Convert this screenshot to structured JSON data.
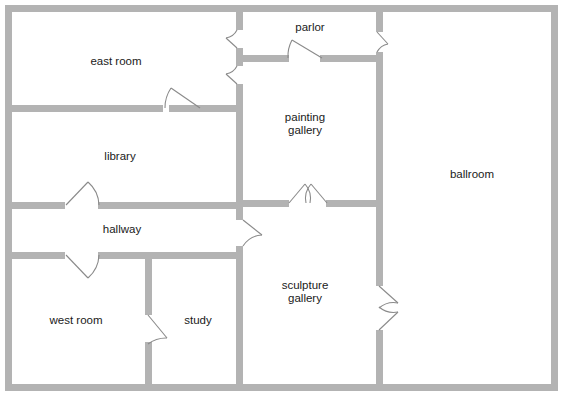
{
  "document": {
    "title": "Museum Floor Plan",
    "width": 570,
    "height": 403,
    "background_color": "#ffffff",
    "wall_color": "#b3b3b3",
    "door_color": "#8a8a8a",
    "label_color": "#1a1a1a"
  },
  "rooms": [
    {
      "id": "east-room",
      "label": "east room",
      "label_lines": [
        "east room"
      ],
      "label_x": 116,
      "label_y": 62,
      "bounds": {
        "x": 8,
        "y": 8,
        "width": 232,
        "height": 100
      }
    },
    {
      "id": "library",
      "label": "library",
      "label_lines": [
        "library"
      ],
      "label_x": 120,
      "label_y": 157,
      "bounds": {
        "x": 8,
        "y": 108,
        "width": 232,
        "height": 97
      }
    },
    {
      "id": "hallway",
      "label": "hallway",
      "label_lines": [
        "hallway"
      ],
      "label_x": 122,
      "label_y": 230,
      "bounds": {
        "x": 8,
        "y": 205,
        "width": 232,
        "height": 50
      }
    },
    {
      "id": "west-room",
      "label": "west room",
      "label_lines": [
        "west room"
      ],
      "label_x": 76,
      "label_y": 321,
      "bounds": {
        "x": 8,
        "y": 255,
        "width": 140,
        "height": 135
      }
    },
    {
      "id": "study",
      "label": "study",
      "label_lines": [
        "study"
      ],
      "label_x": 198,
      "label_y": 321,
      "bounds": {
        "x": 148,
        "y": 255,
        "width": 92,
        "height": 135
      }
    },
    {
      "id": "parlor",
      "label": "parlor",
      "label_lines": [
        "parlor"
      ],
      "label_x": 310,
      "label_y": 28,
      "bounds": {
        "x": 240,
        "y": 8,
        "width": 140,
        "height": 50
      }
    },
    {
      "id": "painting-gallery",
      "label": "painting gallery",
      "label_lines": [
        "painting",
        "gallery"
      ],
      "label_x": 305,
      "label_y": 124,
      "bounds": {
        "x": 240,
        "y": 58,
        "width": 140,
        "height": 147
      }
    },
    {
      "id": "sculpture-gallery",
      "label": "sculpture gallery",
      "label_lines": [
        "sculpture",
        "gallery"
      ],
      "label_x": 305,
      "label_y": 292,
      "bounds": {
        "x": 240,
        "y": 205,
        "width": 140,
        "height": 185
      }
    },
    {
      "id": "ballroom",
      "label": "ballroom",
      "label_lines": [
        "ballroom"
      ],
      "label_x": 472,
      "label_y": 175,
      "bounds": {
        "x": 380,
        "y": 8,
        "width": 178,
        "height": 382
      }
    }
  ],
  "doors": [
    {
      "id": "east-room-to-parlor",
      "between": [
        "east room",
        "parlor"
      ],
      "orientation": "vertical"
    },
    {
      "id": "east-room-to-painting-gallery",
      "between": [
        "east room",
        "painting gallery"
      ],
      "orientation": "vertical"
    },
    {
      "id": "east-room-to-library",
      "between": [
        "east room",
        "library"
      ],
      "orientation": "horizontal"
    },
    {
      "id": "parlor-to-painting-gallery",
      "between": [
        "parlor",
        "painting gallery"
      ],
      "orientation": "horizontal"
    },
    {
      "id": "parlor-to-ballroom",
      "between": [
        "parlor",
        "ballroom"
      ],
      "orientation": "vertical"
    },
    {
      "id": "library-to-hallway",
      "between": [
        "library",
        "hallway"
      ],
      "orientation": "horizontal"
    },
    {
      "id": "hallway-to-west-room",
      "between": [
        "hallway",
        "west room"
      ],
      "orientation": "horizontal"
    },
    {
      "id": "hallway-to-sculpture-gallery",
      "between": [
        "hallway",
        "sculpture gallery"
      ],
      "orientation": "vertical"
    },
    {
      "id": "west-room-to-study",
      "between": [
        "west room",
        "study"
      ],
      "orientation": "vertical"
    },
    {
      "id": "painting-gallery-to-sculpture-gallery",
      "between": [
        "painting gallery",
        "sculpture gallery"
      ],
      "orientation": "horizontal",
      "type": "double"
    },
    {
      "id": "sculpture-gallery-to-ballroom",
      "between": [
        "sculpture gallery",
        "ballroom"
      ],
      "orientation": "vertical",
      "type": "double"
    }
  ]
}
